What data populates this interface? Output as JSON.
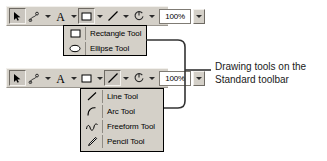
{
  "toolbars": [
    {
      "name": "standard-toolbar-rectangle-open",
      "buttons": [
        {
          "icon": "pointer-icon",
          "label": "Select Objects",
          "pressed": true,
          "has_arrow": false
        },
        {
          "icon": "connector-icon",
          "label": "Connector Tool",
          "pressed": false,
          "has_arrow": true
        },
        {
          "icon": "text-icon",
          "label": "Text Tool",
          "pressed": false,
          "has_arrow": true
        },
        {
          "icon": "rectangle-icon",
          "label": "Rectangle Tool",
          "pressed": true,
          "has_arrow": true
        },
        {
          "icon": "line-icon",
          "label": "Line Tool",
          "pressed": false,
          "has_arrow": true
        },
        {
          "icon": "rotate-icon",
          "label": "Rotate Tool",
          "pressed": false,
          "has_arrow": true
        }
      ],
      "zoom": {
        "value": "100%",
        "arrow": "chevron-down-icon"
      }
    },
    {
      "name": "standard-toolbar-line-open",
      "buttons": [
        {
          "icon": "pointer-icon",
          "label": "Select Objects",
          "pressed": true,
          "has_arrow": false
        },
        {
          "icon": "connector-icon",
          "label": "Connector Tool",
          "pressed": false,
          "has_arrow": true
        },
        {
          "icon": "text-icon",
          "label": "Text Tool",
          "pressed": false,
          "has_arrow": true
        },
        {
          "icon": "rectangle-icon",
          "label": "Rectangle Tool",
          "pressed": false,
          "has_arrow": true
        },
        {
          "icon": "line-icon",
          "label": "Line Tool",
          "pressed": true,
          "has_arrow": true
        },
        {
          "icon": "rotate-icon",
          "label": "Rotate Tool",
          "pressed": false,
          "has_arrow": true
        }
      ],
      "zoom": {
        "value": "100%",
        "arrow": "chevron-down-icon"
      }
    }
  ],
  "menus": [
    {
      "name": "shape-tool-menu",
      "items": [
        {
          "icon": "rectangle-icon",
          "label": "Rectangle Tool"
        },
        {
          "icon": "ellipse-icon",
          "label": "Ellipse Tool"
        }
      ]
    },
    {
      "name": "line-tool-menu",
      "items": [
        {
          "icon": "line-icon",
          "label": "Line Tool"
        },
        {
          "icon": "arc-icon",
          "label": "Arc Tool"
        },
        {
          "icon": "freeform-icon",
          "label": "Freeform Tool"
        },
        {
          "icon": "pencil-icon",
          "label": "Pencil Tool"
        }
      ]
    }
  ],
  "caption": {
    "line1": "Drawing tools on the",
    "line2": "Standard toolbar"
  },
  "colors": {
    "toolbar_face": "#d4d0c8",
    "menu_border": "#000000",
    "text": "#000000",
    "callout_line": "#333333"
  }
}
